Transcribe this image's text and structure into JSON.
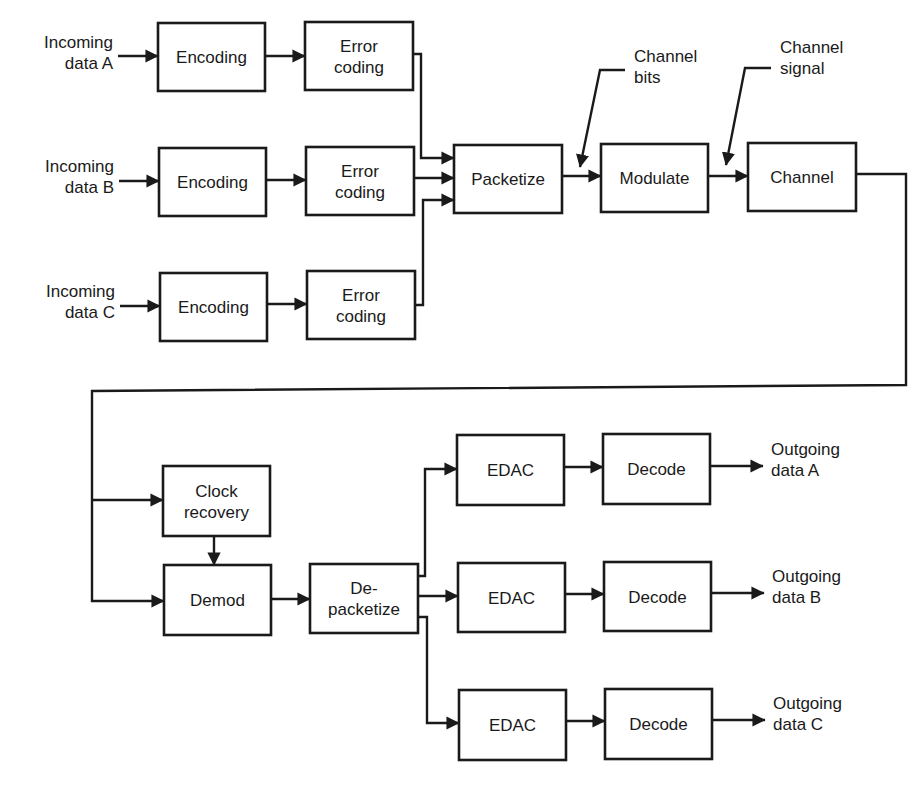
{
  "colors": {
    "ink": "#1a1a1a",
    "background": "#ffffff"
  },
  "boxes": [
    {
      "id": "enc_a",
      "label": [
        "Encoding"
      ],
      "x": 158,
      "y": 23,
      "w": 107,
      "h": 68
    },
    {
      "id": "err_a",
      "label": [
        "Error",
        "coding"
      ],
      "x": 305,
      "y": 22,
      "w": 108,
      "h": 68
    },
    {
      "id": "enc_b",
      "label": [
        "Encoding"
      ],
      "x": 159,
      "y": 148,
      "w": 107,
      "h": 68
    },
    {
      "id": "err_b",
      "label": [
        "Error",
        "coding"
      ],
      "x": 306,
      "y": 147,
      "w": 108,
      "h": 68
    },
    {
      "id": "enc_c",
      "label": [
        "Encoding"
      ],
      "x": 160,
      "y": 273,
      "w": 107,
      "h": 68
    },
    {
      "id": "err_c",
      "label": [
        "Error",
        "coding"
      ],
      "x": 307,
      "y": 271,
      "w": 108,
      "h": 68
    },
    {
      "id": "packetize",
      "label": [
        "Packetize"
      ],
      "x": 454,
      "y": 145,
      "w": 108,
      "h": 68
    },
    {
      "id": "modulate",
      "label": [
        "Modulate"
      ],
      "x": 601,
      "y": 144,
      "w": 107,
      "h": 68
    },
    {
      "id": "channel",
      "label": [
        "Channel"
      ],
      "x": 748,
      "y": 143,
      "w": 108,
      "h": 68
    },
    {
      "id": "clock",
      "label": [
        "Clock",
        "recovery"
      ],
      "x": 163,
      "y": 466,
      "w": 107,
      "h": 70
    },
    {
      "id": "demod",
      "label": [
        "Demod"
      ],
      "x": 164,
      "y": 565,
      "w": 107,
      "h": 70
    },
    {
      "id": "depacketize",
      "label": [
        "De-",
        "packetize"
      ],
      "x": 310,
      "y": 564,
      "w": 108,
      "h": 69
    },
    {
      "id": "edac_a",
      "label": [
        "EDAC"
      ],
      "x": 457,
      "y": 435,
      "w": 107,
      "h": 70
    },
    {
      "id": "dec_a",
      "label": [
        "Decode"
      ],
      "x": 603,
      "y": 434,
      "w": 107,
      "h": 70
    },
    {
      "id": "edac_b",
      "label": [
        "EDAC"
      ],
      "x": 458,
      "y": 563,
      "w": 107,
      "h": 69
    },
    {
      "id": "dec_b",
      "label": [
        "Decode"
      ],
      "x": 604,
      "y": 562,
      "w": 107,
      "h": 69
    },
    {
      "id": "edac_c",
      "label": [
        "EDAC"
      ],
      "x": 459,
      "y": 690,
      "w": 107,
      "h": 70
    },
    {
      "id": "dec_c",
      "label": [
        "Decode"
      ],
      "x": 605,
      "y": 689,
      "w": 107,
      "h": 70
    }
  ],
  "labels": [
    {
      "id": "in_a",
      "lines": [
        "Incoming",
        "data A"
      ],
      "x": 113,
      "y": 48,
      "anchor": "end"
    },
    {
      "id": "in_b",
      "lines": [
        "Incoming",
        "data B"
      ],
      "x": 114,
      "y": 172,
      "anchor": "end"
    },
    {
      "id": "in_c",
      "lines": [
        "Incoming",
        "data C"
      ],
      "x": 115,
      "y": 297,
      "anchor": "end"
    },
    {
      "id": "ch_bits",
      "lines": [
        "Channel",
        "bits"
      ],
      "x": 634,
      "y": 62,
      "anchor": "start"
    },
    {
      "id": "ch_signal",
      "lines": [
        "Channel",
        "signal"
      ],
      "x": 780,
      "y": 53,
      "anchor": "start"
    },
    {
      "id": "out_a",
      "lines": [
        "Outgoing",
        "data A"
      ],
      "x": 771,
      "y": 455,
      "anchor": "start"
    },
    {
      "id": "out_b",
      "lines": [
        "Outgoing",
        "data B"
      ],
      "x": 772,
      "y": 582,
      "anchor": "start"
    },
    {
      "id": "out_c",
      "lines": [
        "Outgoing",
        "data C"
      ],
      "x": 773,
      "y": 709,
      "anchor": "start"
    }
  ],
  "connections": [
    {
      "id": "in_a-enc_a",
      "points": [
        [
          118,
          56
        ],
        [
          158,
          56
        ]
      ],
      "arrow": true
    },
    {
      "id": "enc_a-err_a",
      "points": [
        [
          265,
          56
        ],
        [
          305,
          56
        ]
      ],
      "arrow": true
    },
    {
      "id": "in_b-enc_b",
      "points": [
        [
          119,
          181
        ],
        [
          159,
          181
        ]
      ],
      "arrow": true
    },
    {
      "id": "enc_b-err_b",
      "points": [
        [
          266,
          180
        ],
        [
          306,
          180
        ]
      ],
      "arrow": true
    },
    {
      "id": "in_c-enc_c",
      "points": [
        [
          120,
          306
        ],
        [
          160,
          306
        ]
      ],
      "arrow": true
    },
    {
      "id": "enc_c-err_c",
      "points": [
        [
          267,
          304
        ],
        [
          307,
          304
        ]
      ],
      "arrow": true
    },
    {
      "id": "err_a-packetize",
      "points": [
        [
          413,
          54
        ],
        [
          421,
          54
        ],
        [
          421,
          158
        ],
        [
          454,
          158
        ]
      ],
      "arrow": true
    },
    {
      "id": "err_b-packetize",
      "points": [
        [
          414,
          178
        ],
        [
          454,
          178
        ]
      ],
      "arrow": true
    },
    {
      "id": "err_c-packetize",
      "points": [
        [
          415,
          305
        ],
        [
          423,
          305
        ],
        [
          423,
          200
        ],
        [
          454,
          200
        ]
      ],
      "arrow": true
    },
    {
      "id": "packetize-modulate",
      "points": [
        [
          562,
          176
        ],
        [
          601,
          176
        ]
      ],
      "arrow": true
    },
    {
      "id": "modulate-channel",
      "points": [
        [
          708,
          176
        ],
        [
          748,
          176
        ]
      ],
      "arrow": true
    },
    {
      "id": "bits-pointer",
      "points": [
        [
          625,
          70
        ],
        [
          600,
          70
        ],
        [
          580,
          167
        ]
      ],
      "arrow": true
    },
    {
      "id": "signal-pointer",
      "points": [
        [
          771,
          68
        ],
        [
          745,
          68
        ],
        [
          726,
          165
        ]
      ],
      "arrow": true
    },
    {
      "id": "channel-loop",
      "points": [
        [
          856,
          174
        ],
        [
          906,
          174
        ],
        [
          906,
          385
        ],
        [
          92,
          391
        ],
        [
          92,
          601
        ],
        [
          164,
          601
        ]
      ],
      "arrow": true
    },
    {
      "id": "loop-clock",
      "points": [
        [
          92,
          500
        ],
        [
          163,
          500
        ]
      ],
      "arrow": true
    },
    {
      "id": "clock-demod",
      "points": [
        [
          214,
          536
        ],
        [
          214,
          565
        ]
      ],
      "arrow": true
    },
    {
      "id": "demod-depacketize",
      "points": [
        [
          271,
          599
        ],
        [
          310,
          599
        ]
      ],
      "arrow": true
    },
    {
      "id": "depacketize-edac_a",
      "points": [
        [
          418,
          576
        ],
        [
          425,
          576
        ],
        [
          425,
          469
        ],
        [
          457,
          469
        ]
      ],
      "arrow": true
    },
    {
      "id": "depacketize-edac_b",
      "points": [
        [
          418,
          596
        ],
        [
          458,
          596
        ]
      ],
      "arrow": true
    },
    {
      "id": "depacketize-edac_c",
      "points": [
        [
          418,
          617
        ],
        [
          427,
          617
        ],
        [
          427,
          723
        ],
        [
          459,
          723
        ]
      ],
      "arrow": true
    },
    {
      "id": "edac_a-dec_a",
      "points": [
        [
          564,
          467
        ],
        [
          603,
          467
        ]
      ],
      "arrow": true
    },
    {
      "id": "edac_b-dec_b",
      "points": [
        [
          565,
          594
        ],
        [
          604,
          594
        ]
      ],
      "arrow": true
    },
    {
      "id": "edac_c-dec_c",
      "points": [
        [
          566,
          721
        ],
        [
          605,
          721
        ]
      ],
      "arrow": true
    },
    {
      "id": "dec_a-out",
      "points": [
        [
          710,
          466
        ],
        [
          763,
          466
        ]
      ],
      "arrow": true
    },
    {
      "id": "dec_b-out",
      "points": [
        [
          711,
          593
        ],
        [
          764,
          593
        ]
      ],
      "arrow": true
    },
    {
      "id": "dec_c-out",
      "points": [
        [
          712,
          720
        ],
        [
          765,
          720
        ]
      ],
      "arrow": true
    }
  ]
}
